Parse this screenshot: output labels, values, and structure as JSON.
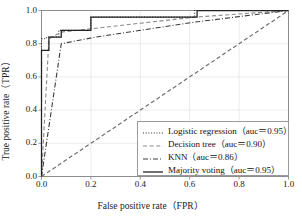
{
  "chart_data": {
    "type": "line",
    "title": "",
    "xlabel": "False positive rate（FPR）",
    "ylabel": "True positive rate（TPR）",
    "xlim": [
      0.0,
      1.0
    ],
    "ylim": [
      0.0,
      1.0
    ],
    "xticks": [
      "0.0",
      "0.2",
      "0.4",
      "0.6",
      "0.8",
      "1.0"
    ],
    "yticks": [
      "0.0",
      "0.2",
      "0.4",
      "0.6",
      "0.8",
      "1.0"
    ],
    "xtick_values": [
      0.0,
      0.2,
      0.4,
      0.6,
      0.8,
      1.0
    ],
    "ytick_values": [
      0.0,
      0.2,
      0.4,
      0.6,
      0.8,
      1.0
    ],
    "grid": true,
    "legend_position": "lower right",
    "series": [
      {
        "name": "Logistic regression",
        "auc": 0.95,
        "legend_label": "Logistic regression（auc＝0.95）",
        "linestyle": "dotted",
        "color": "#2b2b2b",
        "x": [
          0.0,
          0.0,
          0.02,
          0.02,
          0.07,
          0.07,
          0.2,
          0.2,
          0.6,
          0.62,
          0.62,
          1.0
        ],
        "y": [
          0.0,
          0.83,
          0.83,
          0.84,
          0.84,
          0.88,
          0.88,
          0.96,
          0.96,
          0.96,
          1.0,
          1.0
        ]
      },
      {
        "name": "Decision tree",
        "auc": 0.9,
        "legend_label": "Decision tree（auc＝0.90）",
        "linestyle": "dashed",
        "color": "#8a8a8a",
        "x": [
          0.0,
          0.03,
          0.08,
          0.2,
          0.62,
          1.0
        ],
        "y": [
          0.0,
          0.83,
          0.87,
          0.89,
          0.96,
          1.0
        ]
      },
      {
        "name": "KNN",
        "auc": 0.86,
        "legend_label": "KNN（auc＝0.86）",
        "linestyle": "dashdot",
        "color": "#3a3a3a",
        "x": [
          0.0,
          0.08,
          0.22,
          0.62,
          1.0
        ],
        "y": [
          0.0,
          0.8,
          0.84,
          0.93,
          1.0
        ]
      },
      {
        "name": "Majority voting",
        "auc": 0.95,
        "legend_label": "Majority voting（auc＝0.95）",
        "linestyle": "solid",
        "color": "#222222",
        "x": [
          0.0,
          0.0,
          0.03,
          0.03,
          0.08,
          0.08,
          0.2,
          0.2,
          0.63,
          0.63,
          1.0
        ],
        "y": [
          0.0,
          0.76,
          0.76,
          0.84,
          0.84,
          0.88,
          0.88,
          0.96,
          0.96,
          1.0,
          1.0
        ]
      },
      {
        "name": "Chance reference",
        "auc": 0.5,
        "legend_label": "",
        "linestyle": "dashed",
        "color": "#6f6f6f",
        "x": [
          0.0,
          1.0
        ],
        "y": [
          0.0,
          1.0
        ]
      }
    ]
  },
  "legend": {
    "entries": [
      {
        "label": "Logistic regression（auc＝0.95）",
        "style": "dotted"
      },
      {
        "label": "Decision tree（auc＝0.90）",
        "style": "dashed"
      },
      {
        "label": "KNN（auc＝0.86）",
        "style": "dashdot"
      },
      {
        "label": "Majority voting（auc＝0.95）",
        "style": "solid"
      }
    ]
  },
  "colors": {
    "background": "#ffffff",
    "grid": "#e2e2e2",
    "axis": "#8d8d8d",
    "text": "#1a1a1a"
  }
}
